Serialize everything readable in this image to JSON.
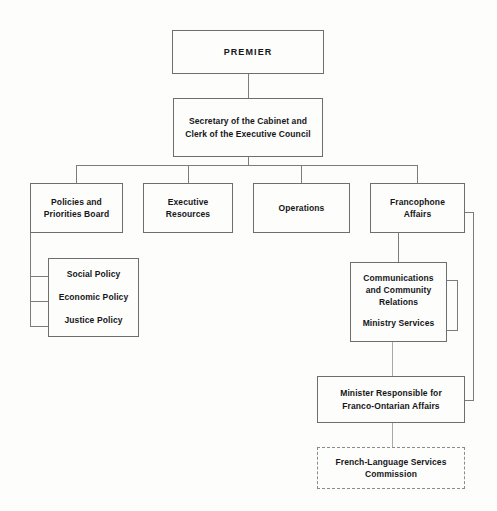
{
  "document": {
    "kind": "organization-chart",
    "colors": {
      "page_background": "#fdfdfc",
      "box_border": "#6e6e70",
      "dashed_border": "#8b8b8e",
      "connector": "#7c7c7f",
      "text": "#16161a"
    }
  },
  "nodes": {
    "premier": {
      "label": "PREMIER"
    },
    "secretary": {
      "line1": "Secretary of the Cabinet and",
      "line2": "Clerk of the Executive Council"
    },
    "policies_board": {
      "line1": "Policies and",
      "line2": "Priorities Board"
    },
    "executive_resources": {
      "line1": "Executive",
      "line2": "Resources"
    },
    "operations": {
      "label": "Operations"
    },
    "francophone_affairs": {
      "line1": "Francophone",
      "line2": "Affairs"
    },
    "policy_committees": {
      "item1": "Social Policy",
      "item2": "Economic Policy",
      "item3": "Justice Policy"
    },
    "communications": {
      "line1": "Communications",
      "line2": "and Community",
      "line3": "Relations",
      "line4": "Ministry Services"
    },
    "minister": {
      "line1": "Minister Responsible for",
      "line2": "Franco-Ontarian Affairs"
    },
    "commission": {
      "line1": "French-Language Services",
      "line2": "Commission"
    }
  }
}
